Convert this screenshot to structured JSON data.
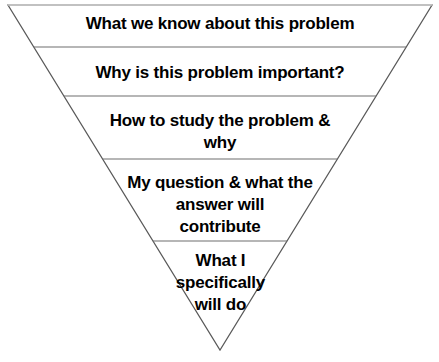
{
  "diagram": {
    "type": "inverted-pyramid",
    "background_color": "#ffffff",
    "outline_color": "#595959",
    "divider_color": "#6e6e6e",
    "text_color": "#000000",
    "apex": {
      "x": 220,
      "y": 350
    },
    "top_left": {
      "x": 8,
      "y": 5
    },
    "top_right": {
      "x": 432,
      "y": 5
    },
    "bands": [
      {
        "index": 0,
        "text": "What we know about this problem",
        "lines": [
          "What we know about this problem"
        ],
        "top_y": 5,
        "bottom_y": 47
      },
      {
        "index": 1,
        "text": "Why is this problem important?",
        "lines": [
          "Why is this problem important?"
        ],
        "top_y": 47,
        "bottom_y": 96
      },
      {
        "index": 2,
        "text": "How to study the problem &\nwhy",
        "lines": [
          "How to study the problem &",
          "why"
        ],
        "top_y": 96,
        "bottom_y": 159
      },
      {
        "index": 3,
        "text": "My question & what the\nanswer will\ncontribute",
        "lines": [
          "My question & what the",
          "answer will",
          "contribute"
        ],
        "top_y": 159,
        "bottom_y": 241
      },
      {
        "index": 4,
        "text": "What I\nspecifically\nwill do",
        "lines": [
          "What I",
          "specifically",
          "will do"
        ],
        "top_y": 241,
        "bottom_y": 350
      }
    ]
  }
}
